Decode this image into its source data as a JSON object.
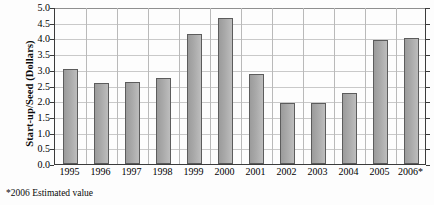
{
  "chart_data": {
    "type": "bar",
    "title": "",
    "xlabel": "",
    "ylabel": "Start-up/Seed (Dollars)",
    "categories": [
      "1995",
      "1996",
      "1997",
      "1998",
      "1999",
      "2000",
      "2001",
      "2002",
      "2003",
      "2004",
      "2005",
      "2006*"
    ],
    "values": [
      3.02,
      2.58,
      2.62,
      2.75,
      4.15,
      4.65,
      2.87,
      1.93,
      1.94,
      2.25,
      3.95,
      4.0
    ],
    "ylim": [
      0.0,
      5.0
    ],
    "ytick_labels": [
      "0.0",
      "0.5",
      "1.0",
      "1.5",
      "2.0",
      "2.5",
      "3.0",
      "3.5",
      "4.0",
      "4.5",
      "5.0"
    ],
    "ytick_values": [
      0.0,
      0.5,
      1.0,
      1.5,
      2.0,
      2.5,
      3.0,
      3.5,
      4.0,
      4.5,
      5.0
    ],
    "grid": true,
    "legend": "none",
    "annotations": [
      "*2006 Estimated value"
    ],
    "bar_fill_color": "#a9a9a9",
    "bar_edge_color": "#5c5c5c",
    "grid_color": "#c9c9c9",
    "axis_color": "#3b3b3b",
    "background_color": "#fdfdfd"
  },
  "footnote": {
    "text": "*2006 Estimated value"
  }
}
